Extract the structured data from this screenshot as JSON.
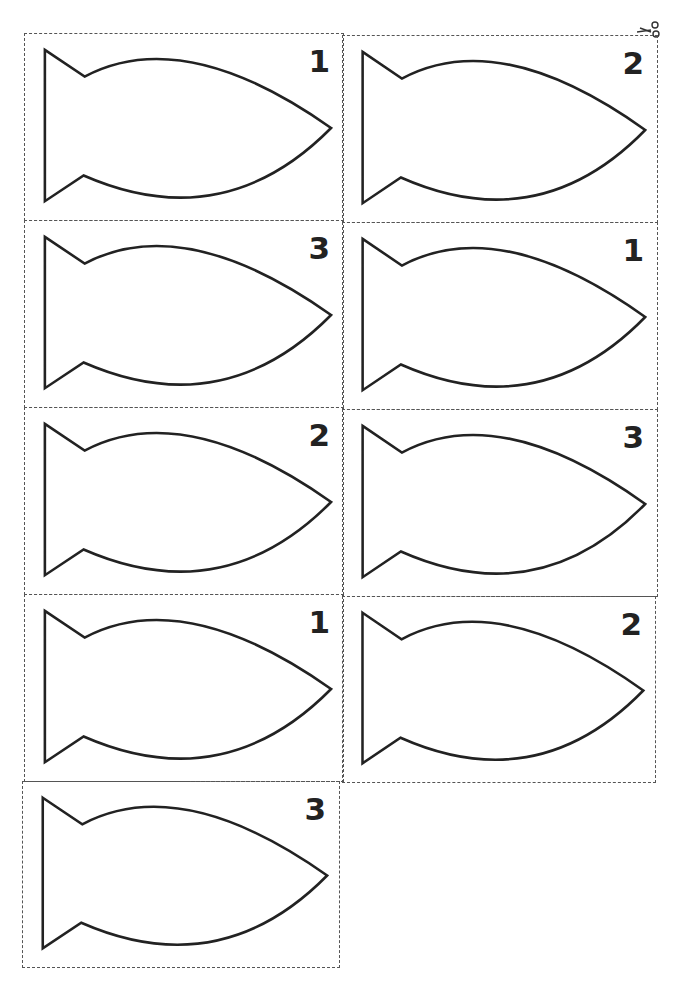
{
  "page": {
    "type": "printable fish cutout cards",
    "columns": 2,
    "rows": 5,
    "cards": [
      {
        "number": "1",
        "row": 0,
        "col": 0
      },
      {
        "number": "2",
        "row": 0,
        "col": 1
      },
      {
        "number": "3",
        "row": 1,
        "col": 0
      },
      {
        "number": "1",
        "row": 1,
        "col": 1
      },
      {
        "number": "2",
        "row": 2,
        "col": 0
      },
      {
        "number": "3",
        "row": 2,
        "col": 1
      },
      {
        "number": "1",
        "row": 3,
        "col": 0
      },
      {
        "number": "2",
        "row": 3,
        "col": 1
      },
      {
        "number": "3",
        "row": 4,
        "col": 0
      }
    ],
    "icons": {
      "cut_marker": "scissors-icon",
      "card_shape": "fish-outline"
    },
    "colors": {
      "outline": "#222222",
      "cut_line": "#555555",
      "background": "#ffffff"
    }
  }
}
